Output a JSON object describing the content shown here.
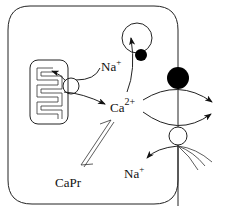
{
  "diagram": {
    "title": "",
    "labels": {
      "na_top": "Na",
      "na_top_sup": "+",
      "ca": "Ca",
      "ca_sup": "2+",
      "capr": "CaPr",
      "na_bottom": "Na",
      "na_bottom_sup": "+"
    },
    "components": [
      {
        "id": "cell-boundary",
        "type": "rounded-rect"
      },
      {
        "id": "mitochondrion",
        "type": "organelle-with-cristae"
      },
      {
        "id": "mito-transporter",
        "type": "open-circle"
      },
      {
        "id": "na-pump-vesicle",
        "type": "circle-with-black-dot"
      },
      {
        "id": "ca-pump",
        "type": "black-circle-on-membrane"
      },
      {
        "id": "na-ca-exchanger",
        "type": "open-circle-on-membrane"
      },
      {
        "id": "capr-binding",
        "type": "double-arrow"
      }
    ],
    "colors": {
      "line": "#222222",
      "fill_black": "#000000",
      "background": "#ffffff"
    }
  }
}
